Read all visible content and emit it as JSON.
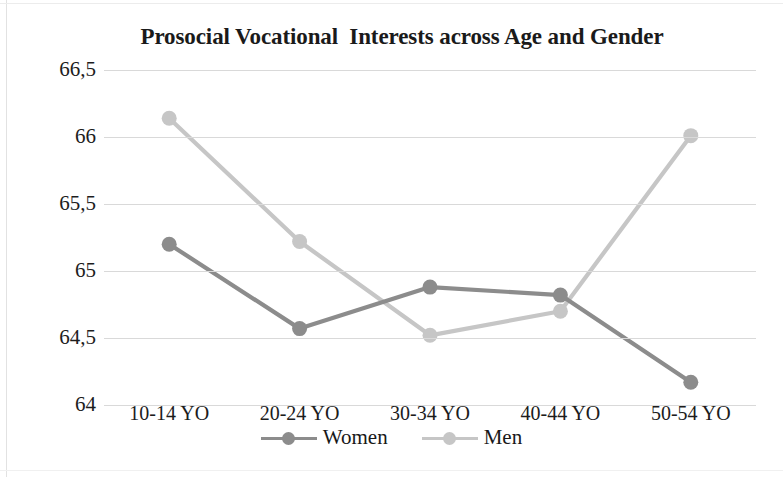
{
  "chart_data": {
    "type": "line",
    "title": "Prosocial Vocational  Interests across Age and Gender",
    "xlabel": "",
    "ylabel": "",
    "categories": [
      "10-14 YO",
      "20-24 YO",
      "30-34 YO",
      "40-44 YO",
      "50-54 YO"
    ],
    "series": [
      {
        "name": "Women",
        "color": "#8c8c8c",
        "values": [
          65.2,
          64.57,
          64.88,
          64.82,
          64.17
        ]
      },
      {
        "name": "Men",
        "color": "#c6c6c6",
        "values": [
          66.14,
          65.22,
          64.52,
          64.7,
          66.01
        ]
      }
    ],
    "ylim": [
      64,
      66.5
    ],
    "yticks": [
      66.5,
      66,
      65.5,
      65,
      64.5,
      64
    ],
    "ytick_labels": [
      "66,5",
      "66",
      "65,5",
      "65",
      "64,5",
      "64"
    ],
    "grid": true,
    "grid_color": "#d9d9d9",
    "legend_position": "bottom",
    "decimal_separator": ","
  },
  "legend": {
    "entries": [
      {
        "label": "Women",
        "color": "#8c8c8c"
      },
      {
        "label": "Men",
        "color": "#c6c6c6"
      }
    ]
  },
  "axes": {
    "y_labels": [
      "66,5",
      "66",
      "65,5",
      "65",
      "64,5",
      "64"
    ],
    "x_labels": [
      "10-14 YO",
      "20-24 YO",
      "30-34 YO",
      "40-44 YO",
      "50-54 YO"
    ]
  }
}
